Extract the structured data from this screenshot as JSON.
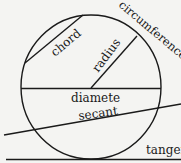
{
  "diagram": {
    "colors": {
      "background": "#f4f4f2",
      "stroke": "#1a1a1a"
    },
    "labels": {
      "chord": "chord",
      "radius": "radius",
      "circumference": "circumference",
      "diameter": "diamete",
      "secant": "secant",
      "tangent": "tangent"
    },
    "circle": {
      "cx": 91,
      "cy": 87,
      "rx": 70,
      "ry": 72
    }
  }
}
